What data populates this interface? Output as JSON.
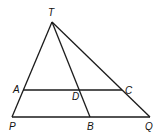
{
  "diagram": {
    "points": {
      "T": {
        "label": "T",
        "x": 52,
        "y": 22,
        "lx": 48,
        "ly": 16
      },
      "A": {
        "label": "A",
        "x": 23,
        "y": 90,
        "lx": 13,
        "ly": 93
      },
      "D": {
        "label": "D",
        "x": 79,
        "y": 90,
        "lx": 72,
        "ly": 100
      },
      "C": {
        "label": "C",
        "x": 122,
        "y": 90,
        "lx": 125,
        "ly": 94
      },
      "P": {
        "label": "P",
        "x": 12,
        "y": 117,
        "lx": 9,
        "ly": 130
      },
      "B": {
        "label": "B",
        "x": 90,
        "y": 117,
        "lx": 87,
        "ly": 130
      },
      "Q": {
        "label": "Q",
        "x": 150,
        "y": 117,
        "lx": 145,
        "ly": 130
      }
    },
    "segments": [
      [
        "T",
        "P"
      ],
      [
        "T",
        "Q"
      ],
      [
        "T",
        "B"
      ],
      [
        "P",
        "Q"
      ],
      [
        "A",
        "C"
      ]
    ],
    "stroke_color": "#1a1a1a"
  }
}
